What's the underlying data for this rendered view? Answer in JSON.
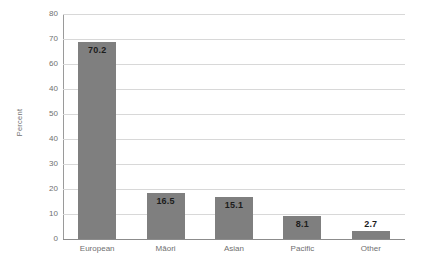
{
  "chart_data": {
    "type": "bar",
    "title": "",
    "subtitle": "",
    "xlabel": "",
    "ylabel": "Percent",
    "categories": [
      "European",
      "Māori",
      "Asian",
      "Pacific",
      "Other"
    ],
    "values": [
      70.2,
      16.5,
      15.1,
      8.1,
      2.7
    ],
    "value_labels": [
      "70.2",
      "16.5",
      "15.1",
      "8.1",
      "2.7"
    ],
    "series": [
      {
        "name": "Percent",
        "values": [
          70.2,
          16.5,
          15.1,
          8.1,
          2.7
        ]
      }
    ],
    "ylim": [
      0,
      80
    ],
    "y_tick_values": [
      80,
      70,
      60,
      50,
      40,
      30,
      20,
      10,
      0
    ],
    "y_tick_labels": [
      "80",
      "70",
      "60",
      "40",
      "50",
      "40",
      "30",
      "20",
      "10",
      "0"
    ],
    "grid": "horizontal",
    "legend": "none",
    "bar_color": "#7f7f7f",
    "gridline_color": "#d8d8d8",
    "axis_color": "#8c8c8c",
    "label_color": "#6f6f6f",
    "value_label_color": "#1c1c1c",
    "value_label_positions": [
      "inside",
      "inside",
      "inside",
      "inside",
      "above"
    ]
  },
  "axis": {
    "y_title": "Percent"
  }
}
